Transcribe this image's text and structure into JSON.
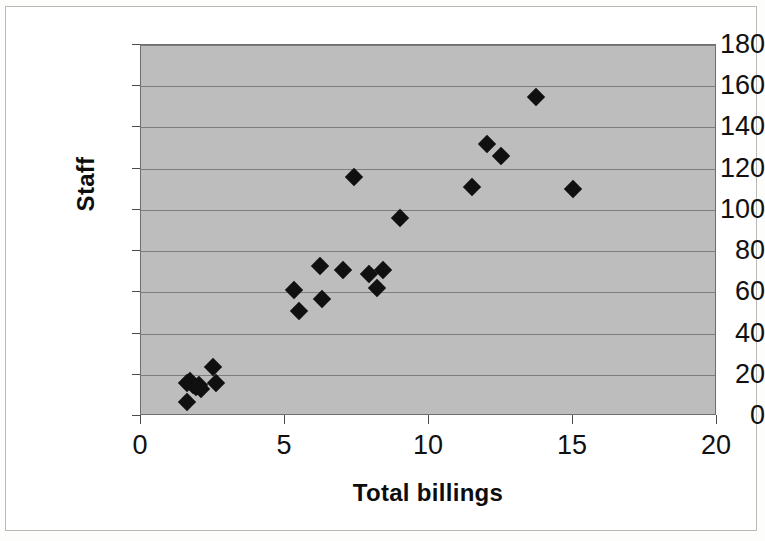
{
  "chart_data": {
    "type": "scatter",
    "title": "",
    "xlabel": "Total billings",
    "ylabel": "Staff",
    "xlim": [
      0,
      20
    ],
    "ylim": [
      0,
      180
    ],
    "xticks": [
      0,
      5,
      10,
      15,
      20
    ],
    "yticks": [
      0,
      20,
      40,
      60,
      80,
      100,
      120,
      140,
      160,
      180
    ],
    "grid": true,
    "legend": "none",
    "plot_background": "#bdbdbd",
    "marker": "diamond",
    "marker_color": "#101010",
    "series": [
      {
        "name": "Firms",
        "points": [
          [
            1.6,
            7
          ],
          [
            1.6,
            16
          ],
          [
            1.7,
            17
          ],
          [
            1.8,
            15
          ],
          [
            1.9,
            14
          ],
          [
            2.0,
            15
          ],
          [
            2.1,
            13
          ],
          [
            2.5,
            24
          ],
          [
            2.6,
            16
          ],
          [
            5.3,
            61
          ],
          [
            5.5,
            51
          ],
          [
            6.2,
            73
          ],
          [
            6.3,
            57
          ],
          [
            7.0,
            71
          ],
          [
            7.4,
            116
          ],
          [
            7.9,
            69
          ],
          [
            8.2,
            62
          ],
          [
            8.4,
            71
          ],
          [
            9.0,
            96
          ],
          [
            11.5,
            111
          ],
          [
            12.0,
            132
          ],
          [
            12.5,
            126
          ],
          [
            13.7,
            155
          ],
          [
            15.0,
            110
          ]
        ]
      }
    ]
  },
  "axes": {
    "x_tick_labels": [
      "0",
      "5",
      "10",
      "15",
      "20"
    ],
    "y_tick_labels": [
      "0",
      "20",
      "40",
      "60",
      "80",
      "100",
      "120",
      "140",
      "160",
      "180"
    ],
    "x_axis_title": "Total billings",
    "y_axis_title": "Staff"
  }
}
